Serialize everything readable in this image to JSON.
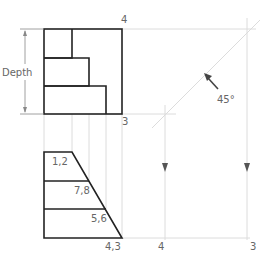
{
  "diagram": {
    "type": "orthographic-projection",
    "colors": {
      "object_line": "#222222",
      "guide_line": "#dcdcdc",
      "label_text": "#666666",
      "arrow": "#444444"
    },
    "top_view": {
      "dimension_label": "Depth",
      "corner_labels": {
        "top_right": "4",
        "bottom_right": "3"
      }
    },
    "miter": {
      "angle_label": "45°"
    },
    "bottom_view": {
      "point_labels": [
        "1,2",
        "7,8",
        "5,6",
        "4,3"
      ],
      "projection_labels": [
        "4",
        "3"
      ]
    }
  }
}
